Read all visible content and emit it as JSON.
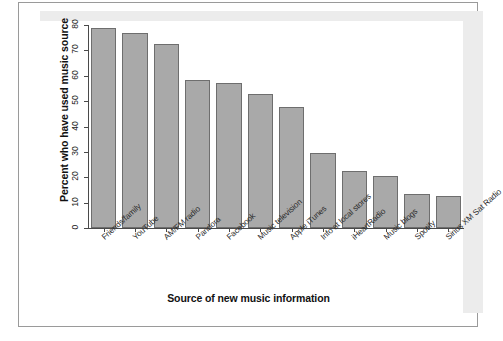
{
  "figure": {
    "frame_color": "#9a9a9a",
    "panel_color": "#ececec",
    "canvas_color": "#ffffff"
  },
  "chart_data": {
    "type": "bar",
    "title": "",
    "xlabel": "Source of new music information",
    "ylabel": "Percent who have used music source",
    "ylim": [
      0,
      80
    ],
    "yticks": [
      0,
      10,
      20,
      30,
      40,
      50,
      60,
      70,
      80
    ],
    "ytick_labels": [
      "0",
      "10",
      "20",
      "30",
      "40",
      "50",
      "60",
      "70",
      "80"
    ],
    "grid": false,
    "legend": null,
    "bar_fill_color": "#a9a9a9",
    "bar_edge_color": "#6e6e6e",
    "categories": [
      "Friends/family",
      "YouTube",
      "AM/FM radio",
      "Pandora",
      "Facebook",
      "Music television",
      "Apple iTunes",
      "Info at local stores",
      "iHeartRadio",
      "Music blogs",
      "Spotify",
      "Sirius XM Sat Radio"
    ],
    "values": [
      79,
      77,
      72.5,
      58.5,
      57,
      53,
      47.5,
      29.5,
      22.5,
      20.5,
      13.5,
      12.5
    ]
  }
}
